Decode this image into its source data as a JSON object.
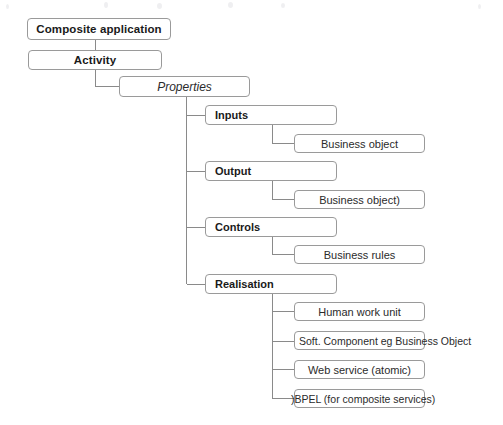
{
  "diagram": {
    "type": "tree-diagram",
    "style": {
      "box_border_color": "#9a9a9a",
      "connector_color": "#8a8a8a",
      "background_color": "#ffffff",
      "text_color": "#1a1a1a"
    },
    "nodes": {
      "composite_application": "Composite application",
      "activity": "Activity",
      "properties": "Properties",
      "inputs": "Inputs",
      "inputs_child": "Business object",
      "output": "Output",
      "output_child": "Business object)",
      "controls": "Controls",
      "controls_child": "Business rules",
      "realisation": "Realisation",
      "realisation_children": [
        "Human work unit",
        "Soft. Component eg Business Object",
        "Web service (atomic)",
        ")BPEL (for composite services)"
      ]
    }
  }
}
